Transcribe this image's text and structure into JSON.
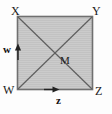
{
  "figure": {
    "type": "geometry-diagram",
    "shape": "square",
    "colors": {
      "fill": "#c9c9c9",
      "border": "#6e6e6e",
      "diagonal": "#5f5f5f",
      "text": "#1b1b1b",
      "background": "#fdfdfd"
    },
    "square": {
      "left": 17,
      "top": 16,
      "right": 93,
      "bottom": 90,
      "width": 76,
      "height": 74
    },
    "vertices": [
      {
        "id": "X",
        "label": "X",
        "position": "top-left"
      },
      {
        "id": "Y",
        "label": "Y",
        "position": "top-right"
      },
      {
        "id": "Z",
        "label": "Z",
        "position": "bottom-right"
      },
      {
        "id": "W",
        "label": "W",
        "position": "bottom-left"
      }
    ],
    "center_point": {
      "id": "M",
      "label": "M"
    },
    "vectors": [
      {
        "id": "w",
        "label": "w",
        "direction": "up",
        "edge": "left"
      },
      {
        "id": "z",
        "label": "z",
        "direction": "right",
        "edge": "bottom"
      }
    ],
    "diagonals": [
      {
        "from": "X",
        "to": "Z"
      },
      {
        "from": "W",
        "to": "Y"
      }
    ]
  }
}
